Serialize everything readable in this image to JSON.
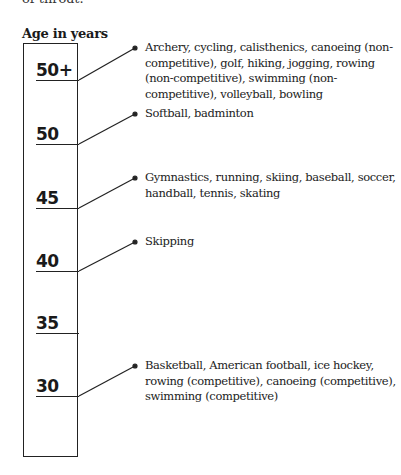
{
  "top_fragment": "of throat.",
  "heading": "Age in years",
  "ages": [
    {
      "label": "50+",
      "activities": "Archery,  cycling, calisthenics, canoeing (non-competitive), golf, hiking, jogging, rowing (non-competitive), swimming (non-competitive), volleyball, bowling"
    },
    {
      "label": "50",
      "activities": "Softball, badminton"
    },
    {
      "label": "45",
      "activities": "Gymnastics, running, skiing, baseball, soccer, handball, tennis, skating"
    },
    {
      "label": "40",
      "activities": "Skipping"
    },
    {
      "label": "35",
      "activities": ""
    },
    {
      "label": "30",
      "activities": "Basketball, American football, ice hockey, rowing (competitive), canoeing (competitive), swimming (competitive)"
    }
  ]
}
